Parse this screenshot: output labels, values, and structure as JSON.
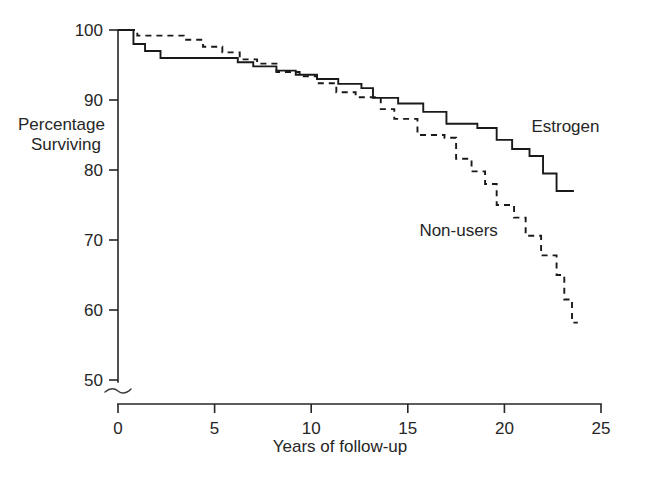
{
  "chart_data": {
    "type": "line",
    "title": "",
    "subtitle": "",
    "xlabel": "Years of follow-up",
    "ylabel": "Percentage Surviving",
    "ylabel_line1": "Percentage",
    "ylabel_line2": "Surviving",
    "xlim": [
      0,
      25
    ],
    "ylim": [
      50,
      100
    ],
    "y_axis_break": true,
    "grid": false,
    "legend_position": "inline-annotation",
    "xticks": [
      0,
      5,
      10,
      15,
      20,
      25
    ],
    "xtick_labels": [
      "0",
      "5",
      "10",
      "15",
      "20",
      "25"
    ],
    "yticks": [
      50,
      60,
      70,
      80,
      90,
      100
    ],
    "ytick_labels": [
      "50",
      "60",
      "70",
      "80",
      "90",
      "100"
    ],
    "annotations": [
      {
        "text": "Estrogen",
        "x": 21.4,
        "y": 85.5
      },
      {
        "text": "Non-users",
        "x": 15.6,
        "y": 70.6
      }
    ],
    "series": [
      {
        "name": "Estrogen",
        "style": "solid",
        "steps": [
          [
            0.0,
            100.0
          ],
          [
            0.8,
            98.0
          ],
          [
            1.4,
            97.0
          ],
          [
            2.2,
            96.0
          ],
          [
            6.2,
            95.4
          ],
          [
            7.0,
            94.8
          ],
          [
            8.2,
            94.2
          ],
          [
            9.2,
            93.6
          ],
          [
            10.3,
            93.0
          ],
          [
            11.4,
            92.3
          ],
          [
            12.6,
            91.7
          ],
          [
            13.2,
            90.3
          ],
          [
            14.5,
            89.5
          ],
          [
            15.8,
            88.3
          ],
          [
            17.0,
            86.6
          ],
          [
            18.6,
            86.0
          ],
          [
            19.6,
            84.3
          ],
          [
            20.4,
            83.0
          ],
          [
            21.3,
            82.0
          ],
          [
            22.0,
            79.5
          ],
          [
            22.7,
            77.0
          ],
          [
            23.6,
            77.0
          ]
        ]
      },
      {
        "name": "Non-users",
        "style": "dashed",
        "steps": [
          [
            0.0,
            100.0
          ],
          [
            1.0,
            99.2
          ],
          [
            3.4,
            98.6
          ],
          [
            4.4,
            97.6
          ],
          [
            5.4,
            96.8
          ],
          [
            6.3,
            95.8
          ],
          [
            7.2,
            95.2
          ],
          [
            8.2,
            94.0
          ],
          [
            9.4,
            93.4
          ],
          [
            10.3,
            92.4
          ],
          [
            11.3,
            91.1
          ],
          [
            12.3,
            90.4
          ],
          [
            13.6,
            88.7
          ],
          [
            14.3,
            87.3
          ],
          [
            15.5,
            85.0
          ],
          [
            16.9,
            84.6
          ],
          [
            17.5,
            81.6
          ],
          [
            18.3,
            79.8
          ],
          [
            19.0,
            78.0
          ],
          [
            19.6,
            75.0
          ],
          [
            20.5,
            73.2
          ],
          [
            21.1,
            70.6
          ],
          [
            21.9,
            67.8
          ],
          [
            22.7,
            65.0
          ],
          [
            23.1,
            61.5
          ],
          [
            23.5,
            58.2
          ],
          [
            23.8,
            58.2
          ]
        ]
      }
    ]
  }
}
